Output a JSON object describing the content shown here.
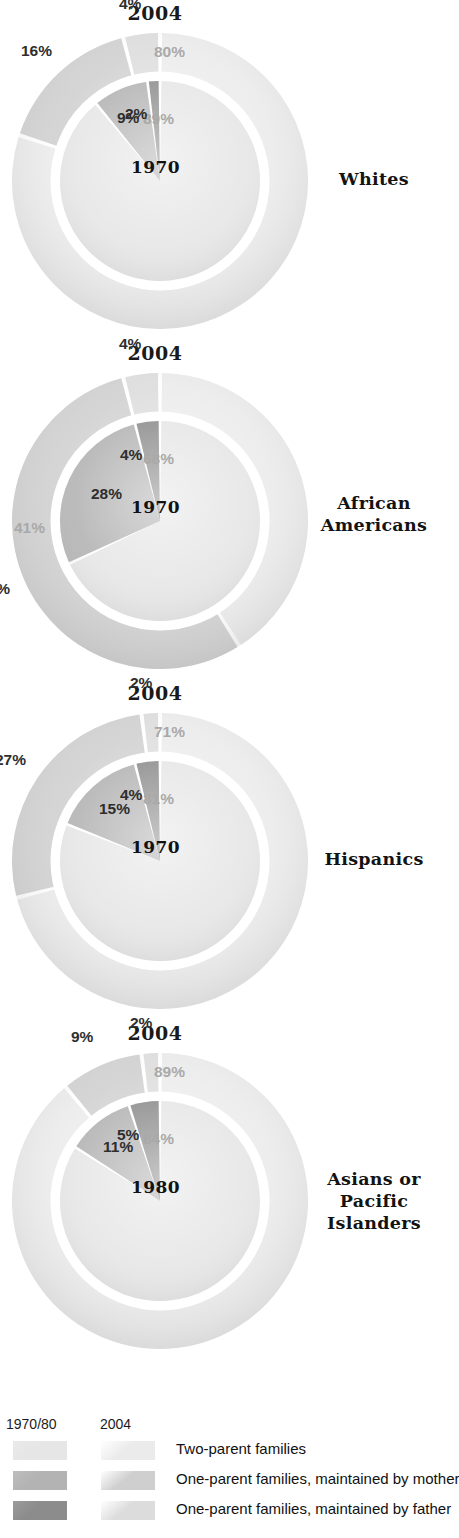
{
  "chart_data": [
    {
      "type": "pie",
      "title": "Whites",
      "outer_year": "2004",
      "inner_year": "1970",
      "categories": [
        "Two-parent families",
        "One-parent families, maintained by mother",
        "One-parent families, maintained by father"
      ],
      "series": [
        {
          "name": "1970",
          "ring": "inner",
          "values": [
            89,
            9,
            2
          ],
          "labels": [
            "89%",
            "9%",
            "2%"
          ]
        },
        {
          "name": "2004",
          "ring": "outer",
          "values": [
            80,
            16,
            4
          ],
          "labels": [
            "80%",
            "16%",
            "4%"
          ]
        }
      ]
    },
    {
      "type": "pie",
      "title": "African Americans",
      "outer_year": "2004",
      "inner_year": "1970",
      "categories": [
        "Two-parent families",
        "One-parent families, maintained by mother",
        "One-parent families, maintained by father"
      ],
      "series": [
        {
          "name": "1970",
          "ring": "inner",
          "values": [
            68,
            28,
            4
          ],
          "labels": [
            "68%",
            "28%",
            "4%"
          ]
        },
        {
          "name": "2004",
          "ring": "outer",
          "values": [
            41,
            55,
            4
          ],
          "labels": [
            "41%",
            "55%",
            "4%"
          ]
        }
      ]
    },
    {
      "type": "pie",
      "title": "Hispanics",
      "outer_year": "2004",
      "inner_year": "1970",
      "categories": [
        "Two-parent families",
        "One-parent families, maintained by mother",
        "One-parent families, maintained by father"
      ],
      "series": [
        {
          "name": "1970",
          "ring": "inner",
          "values": [
            81,
            15,
            4
          ],
          "labels": [
            "81%",
            "15%",
            "4%"
          ]
        },
        {
          "name": "2004",
          "ring": "outer",
          "values": [
            71,
            27,
            2
          ],
          "labels": [
            "71%",
            "27%",
            "2%"
          ]
        }
      ]
    },
    {
      "type": "pie",
      "title": "Asians or Pacific Islanders",
      "outer_year": "2004",
      "inner_year": "1980",
      "categories": [
        "Two-parent families",
        "One-parent families, maintained by mother",
        "One-parent families, maintained by father"
      ],
      "series": [
        {
          "name": "1980",
          "ring": "inner",
          "values": [
            84,
            11,
            5
          ],
          "labels": [
            "84%",
            "11%",
            "5%"
          ]
        },
        {
          "name": "2004",
          "ring": "outer",
          "values": [
            89,
            9,
            2
          ],
          "labels": [
            "89%",
            "9%",
            "2%"
          ]
        }
      ]
    }
  ],
  "legend": {
    "header_old": "1970/80",
    "header_new": "2004",
    "rows": [
      {
        "label": "Two-parent families"
      },
      {
        "label": "One-parent families, maintained by mother"
      },
      {
        "label": "One-parent families, maintained by father"
      }
    ]
  },
  "colors": {
    "inner_two_parent": "#e6e6e6",
    "inner_mother": "#b3b3b3",
    "inner_father": "#8c8c8c",
    "outer_two_parent": "#ebebeb",
    "outer_mother": "#cfcfcf",
    "outer_father": "#dcdcdc",
    "gap": "#ffffff",
    "label_pale": "#a9a9a9",
    "label_dark": "#2e2e2e",
    "title": "#131313"
  }
}
